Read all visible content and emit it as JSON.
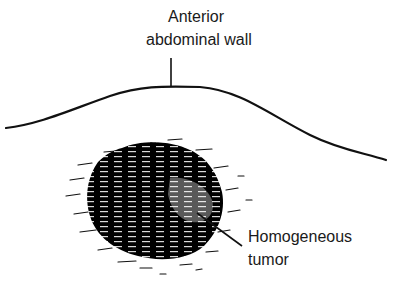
{
  "diagram": {
    "labels": {
      "wall_line1": "Anterior",
      "wall_line2": "abdominal wall",
      "tumor_line1": "Homogeneous",
      "tumor_line2": "tumor"
    },
    "colors": {
      "ink": "#111111",
      "background": "#ffffff"
    }
  }
}
